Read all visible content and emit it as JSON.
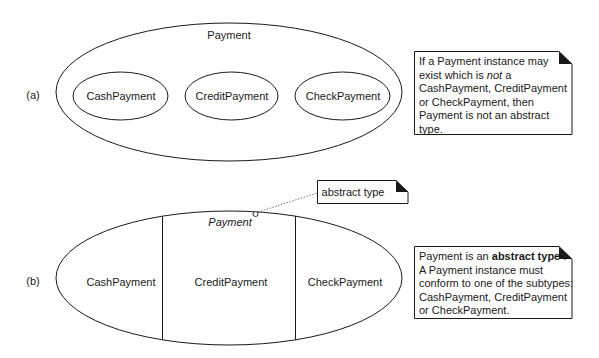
{
  "panel_a": {
    "label": "(a)",
    "supertype": "Payment",
    "subtypes": [
      "CashPayment",
      "CreditPayment",
      "CheckPayment"
    ],
    "note": {
      "line1": "If a  Payment instance may",
      "line2_pre": "exist which is ",
      "line2_em": "not",
      "line2_post": " a",
      "line3": "CashPayment, CreditPayment",
      "line4": "or CheckPayment, then",
      "line5": "Payment is not an abstract",
      "line6": "type."
    }
  },
  "panel_b": {
    "label": "(b)",
    "supertype": "Payment",
    "subtypes": [
      "CashPayment",
      "CreditPayment",
      "CheckPayment"
    ],
    "callout": "abstract type",
    "note": {
      "line1_pre": "Payment is an ",
      "line1_strong": "abstract type",
      "line1_post": " .",
      "line2": "A Payment instance must",
      "line3": "conform to one of the subtypes:",
      "line4": "CashPayment, CreditPayment",
      "line5": "or CheckPayment."
    }
  },
  "colors": {
    "stroke": "#1a1a1a",
    "background": "#ffffff"
  }
}
